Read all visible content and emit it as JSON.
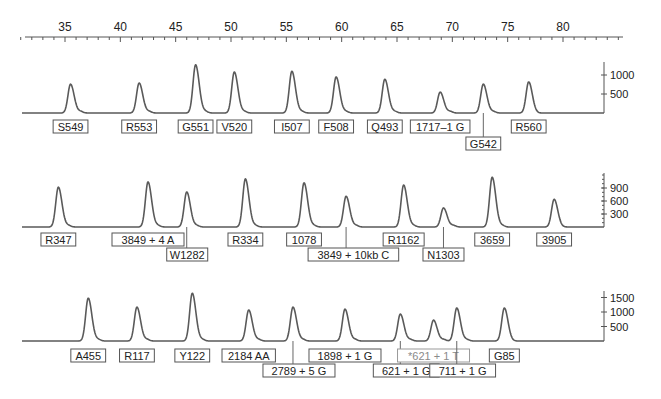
{
  "chart_data": {
    "type": "line",
    "title": "",
    "xlabel": "",
    "ylabel": "",
    "x_axis": {
      "position": "top",
      "range": [
        31,
        85
      ],
      "major_ticks": [
        35,
        40,
        45,
        50,
        55,
        60,
        65,
        70,
        75,
        80
      ],
      "minor_tick_step": 1
    },
    "panels": [
      {
        "name": "panel-1",
        "y_ticks": [
          500,
          1000
        ],
        "peaks": [
          {
            "label": "S549",
            "x": 35.5,
            "height": 760
          },
          {
            "label": "R553",
            "x": 41.7,
            "height": 790
          },
          {
            "label": "G551",
            "x": 46.8,
            "height": 1270
          },
          {
            "label": "V520",
            "x": 50.3,
            "height": 1080
          },
          {
            "label": "I507",
            "x": 55.5,
            "height": 1100
          },
          {
            "label": "F508",
            "x": 59.5,
            "height": 950
          },
          {
            "label": "Q493",
            "x": 63.9,
            "height": 890
          },
          {
            "label": "1717–1 G",
            "x": 68.9,
            "height": 550
          },
          {
            "label": "G542",
            "x": 72.8,
            "height": 760,
            "leader": true
          },
          {
            "label": "R560",
            "x": 76.9,
            "height": 820
          }
        ]
      },
      {
        "name": "panel-2",
        "y_ticks": [
          300,
          600,
          900
        ],
        "peaks": [
          {
            "label": "R347",
            "x": 34.4,
            "height": 920
          },
          {
            "label": "3849 + 4 A",
            "x": 42.5,
            "height": 1040
          },
          {
            "label": "W1282",
            "x": 46.0,
            "height": 810,
            "leader": true
          },
          {
            "label": "R334",
            "x": 51.3,
            "height": 1110
          },
          {
            "label": "1078",
            "x": 56.6,
            "height": 1020
          },
          {
            "label": "3849 + 10kb C",
            "x": 60.4,
            "height": 710,
            "leader": true
          },
          {
            "label": "R1162",
            "x": 65.6,
            "height": 970
          },
          {
            "label": "N1303",
            "x": 69.2,
            "height": 440,
            "leader": true
          },
          {
            "label": "3659",
            "x": 73.6,
            "height": 1150
          },
          {
            "label": "3905",
            "x": 79.2,
            "height": 640
          }
        ]
      },
      {
        "name": "panel-3",
        "y_ticks": [
          500,
          1000,
          1500
        ],
        "peaks": [
          {
            "label": "A455",
            "x": 37.1,
            "height": 1480
          },
          {
            "label": "R117",
            "x": 41.5,
            "height": 1170
          },
          {
            "label": "Y122",
            "x": 46.5,
            "height": 1650
          },
          {
            "label": "2184 AA",
            "x": 51.6,
            "height": 1070
          },
          {
            "label": "2789 + 5 G",
            "x": 55.6,
            "height": 1170,
            "leader": true
          },
          {
            "label": "1898 + 1 G",
            "x": 60.3,
            "height": 1100
          },
          {
            "label": "621 + 1 G",
            "x": 65.3,
            "height": 930,
            "leader": true
          },
          {
            "label": "*621 + 1 T",
            "x": 68.3,
            "height": 720,
            "grey": true
          },
          {
            "label": "711 + 1 G",
            "x": 70.4,
            "height": 1140,
            "leader": true
          },
          {
            "label": "G85",
            "x": 74.7,
            "height": 1140
          }
        ]
      }
    ]
  },
  "colors": {
    "trace": "#5a5a5a",
    "axis": "#555555",
    "label_border": "#555555",
    "grey_label": "#8a8a8a"
  }
}
